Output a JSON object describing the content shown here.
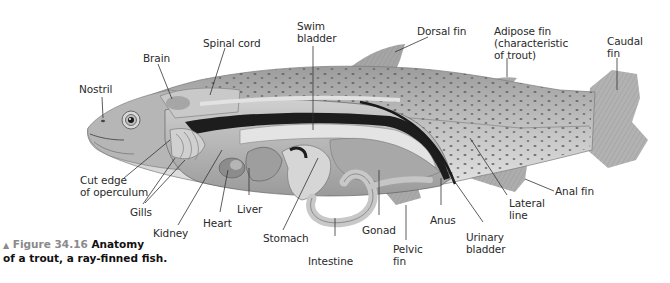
{
  "figure": {
    "caption": {
      "marker": "▲",
      "number": "Figure 34.16",
      "title_line1": "Anatomy",
      "title_line2": "of a trout, a ray-finned fish."
    },
    "labels": {
      "nostril": "Nostril",
      "brain": "Brain",
      "spinal_cord": "Spinal cord",
      "swim_bladder": "Swim\nbladder",
      "dorsal_fin": "Dorsal fin",
      "adipose_fin": "Adipose fin\n(characteristic\nof trout)",
      "caudal_fin": "Caudal\nfin",
      "cut_edge_operculum": "Cut edge\nof operculum",
      "gills": "Gills",
      "kidney": "Kidney",
      "heart": "Heart",
      "liver": "Liver",
      "stomach": "Stomach",
      "intestine": "Intestine",
      "gonad": "Gonad",
      "pelvic_fin": "Pelvic\nfin",
      "anus": "Anus",
      "urinary_bladder": "Urinary\nbladder",
      "lateral_line": "Lateral\nline",
      "anal_fin": "Anal fin"
    },
    "colors": {
      "skin": "#b8b8b8",
      "spots": "#6a6a6a",
      "fin": "#a9a9a9",
      "organ_light": "#d9d9d9",
      "organ_dark": "#1c1c1c",
      "caption_accent": "#8a8a8a",
      "leader_line": "#333333"
    }
  }
}
